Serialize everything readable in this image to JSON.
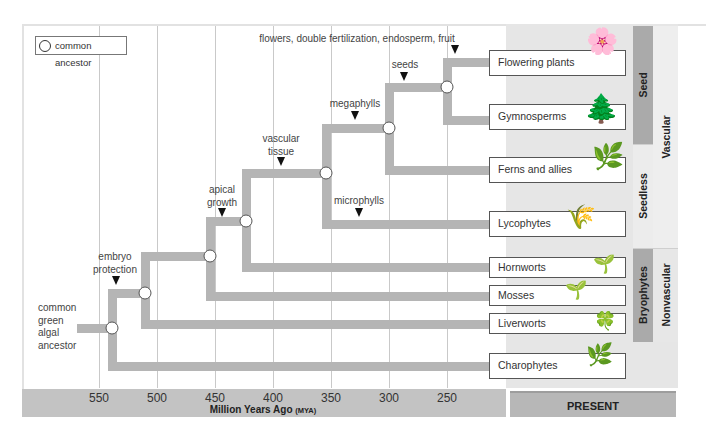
{
  "legend": {
    "icon": "common-ancestor-circle-icon",
    "label": "common ancestor"
  },
  "root_label": "common\ngreen\nalgal\nancestor",
  "axis": {
    "title": "Million Years Ago",
    "unit": "(MYA)",
    "ticks": [
      "550",
      "500",
      "450",
      "400",
      "350",
      "300",
      "250"
    ],
    "present_label": "PRESENT"
  },
  "traits": {
    "embryo_protection": "embryo\nprotection",
    "apical_growth": "apical\ngrowth",
    "vascular_tissue": "vascular\ntissue",
    "microphylls": "microphylls",
    "megaphylls": "megaphylls",
    "seeds": "seeds",
    "flowers": "flowers, double fertilization, endosperm, fruit"
  },
  "taxa": [
    {
      "label": "Flowering plants",
      "icon": "flowering-plant-icon",
      "glyph": "🌸"
    },
    {
      "label": "Gymnosperms",
      "icon": "pine-cone-icon",
      "glyph": "🌲"
    },
    {
      "label": "Ferns and allies",
      "icon": "fern-icon",
      "glyph": "🌿"
    },
    {
      "label": "Lycophytes",
      "icon": "lycophyte-icon",
      "glyph": "🌾"
    },
    {
      "label": "Hornworts",
      "icon": "hornwort-icon",
      "glyph": "🌱"
    },
    {
      "label": "Mosses",
      "icon": "moss-icon",
      "glyph": "🌱"
    },
    {
      "label": "Liverworts",
      "icon": "liverwort-icon",
      "glyph": "🍀"
    },
    {
      "label": "Charophytes",
      "icon": "charophyte-alga-icon",
      "glyph": "🌿"
    }
  ],
  "clades": {
    "seed": "Seed",
    "seedless": "Seedless",
    "vascular": "Vascular",
    "bryophytes": "Bryophytes",
    "nonvascular": "Nonvascular"
  },
  "colors": {
    "branch": "#b5b5b5",
    "clade_dark": "#a9a9a9",
    "clade_light": "#e9e9e9",
    "axis_bar": "#c3c3c3"
  }
}
